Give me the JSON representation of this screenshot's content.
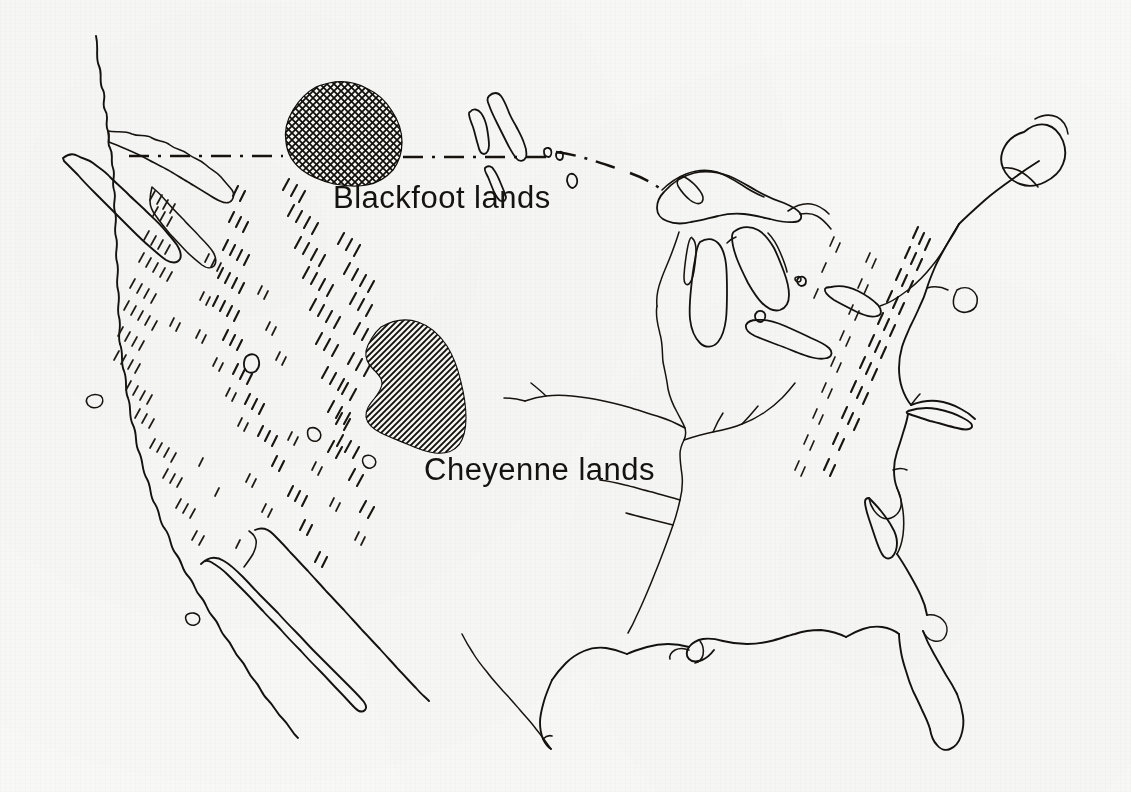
{
  "document": {
    "type": "map",
    "title": "Blackfoot and Cheyenne lands",
    "region": "North America — continental United States and southern Canada",
    "style": "pen-and-ink line drawing on off-white paper",
    "background_color": "#f8f8f6",
    "ink_color": "#14120f"
  },
  "labels": [
    {
      "id": "blackfoot",
      "text": "Blackfoot lands",
      "x": 333,
      "y": 180,
      "font_size": 31
    },
    {
      "id": "cheyenne",
      "text": "Cheyenne lands",
      "x": 424,
      "y": 452,
      "font_size": 31
    }
  ],
  "territories": [
    {
      "name": "Blackfoot lands",
      "hatch": "cross-hatch",
      "approx_center": [
        348,
        132
      ],
      "approx_extent_px": [
        290,
        82,
        120,
        102
      ],
      "label_ref": "blackfoot"
    },
    {
      "name": "Cheyenne lands",
      "hatch": "diagonal-hatch",
      "approx_center": [
        420,
        385
      ],
      "approx_extent_px": [
        370,
        318,
        120,
        135
      ],
      "label_ref": "cheyenne"
    }
  ],
  "features": {
    "international_border": {
      "name": "United States – Canada border",
      "style": "dash-dot"
    },
    "mountains": {
      "style": "hachure tick chains",
      "ranges": [
        "Coast Ranges",
        "Sierra Nevada",
        "Cascade Range",
        "Rocky Mountains",
        "Appalachian Mountains"
      ]
    },
    "water_bodies": [
      "Lake Superior",
      "Lake Michigan",
      "Lake Huron",
      "Lake Erie",
      "Lake Ontario",
      "Lake Winnipeg",
      "Lake of the Woods",
      "Great Salt Lake",
      "Gulf of California",
      "Chesapeake Bay",
      "Delaware Bay",
      "Puget Sound",
      "San Francisco Bay",
      "Long Island Sound"
    ],
    "rivers": [
      "Mississippi River",
      "Missouri River",
      "Ohio River",
      "Arkansas River",
      "Rio Grande",
      "St. Lawrence River"
    ],
    "landmasses": [
      "Vancouver Island",
      "Baja California",
      "Florida Peninsula",
      "Cape Cod",
      "Long Island",
      "Nova Scotia"
    ]
  }
}
